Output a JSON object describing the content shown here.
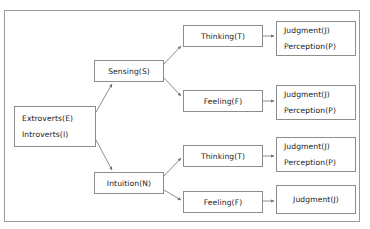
{
  "diagram": {
    "background_color": "#ffffff",
    "border_color": "#9a9a9a",
    "box_border_color": "#8d8d8d",
    "text_color": "#1a1a1a",
    "edge_color": "#6e6e6e",
    "nodes": [
      {
        "id": "attitude",
        "lines": [
          "Extroverts(E)",
          "Introverts(I)"
        ],
        "x": 14,
        "y": 106,
        "w": 82,
        "h": 41
      },
      {
        "id": "sensing",
        "lines": [
          "Sensing(S)"
        ],
        "x": 94,
        "y": 60,
        "w": 70,
        "h": 22
      },
      {
        "id": "intuition",
        "lines": [
          "Intuition(N)"
        ],
        "x": 94,
        "y": 172,
        "w": 70,
        "h": 22
      },
      {
        "id": "thinking-top",
        "lines": [
          "Thinking(T)"
        ],
        "x": 183,
        "y": 25,
        "w": 80,
        "h": 22
      },
      {
        "id": "feeling-top",
        "lines": [
          "Feeling(F)"
        ],
        "x": 183,
        "y": 90,
        "w": 80,
        "h": 22
      },
      {
        "id": "thinking-bottom",
        "lines": [
          "Thinking(T)"
        ],
        "x": 183,
        "y": 145,
        "w": 80,
        "h": 22
      },
      {
        "id": "feeling-bottom",
        "lines": [
          "Feeling(F)"
        ],
        "x": 183,
        "y": 191,
        "w": 80,
        "h": 22
      },
      {
        "id": "outcome-1",
        "lines": [
          "Judgment(J)",
          "Perception(P)"
        ],
        "x": 276,
        "y": 21,
        "w": 80,
        "h": 35
      },
      {
        "id": "outcome-2",
        "lines": [
          "Judgment(J)",
          "Perception(P)"
        ],
        "x": 276,
        "y": 85,
        "w": 80,
        "h": 35
      },
      {
        "id": "outcome-3",
        "lines": [
          "Judgment(J)",
          "Perception(P)"
        ],
        "x": 276,
        "y": 137,
        "w": 80,
        "h": 35
      },
      {
        "id": "outcome-4",
        "lines": [
          "Judgment(J)"
        ],
        "x": 276,
        "y": 185,
        "w": 80,
        "h": 29
      }
    ],
    "edges": [
      {
        "id": "attitude-to-sensing",
        "from": "attitude",
        "to": "sensing",
        "x1": 96,
        "y1": 112,
        "x2": 112,
        "y2": 84
      },
      {
        "id": "attitude-to-intuition",
        "from": "attitude",
        "to": "intuition",
        "x1": 96,
        "y1": 140,
        "x2": 112,
        "y2": 170
      },
      {
        "id": "sensing-to-thinking",
        "from": "sensing",
        "to": "thinking-top",
        "x1": 164,
        "y1": 64,
        "x2": 181,
        "y2": 46
      },
      {
        "id": "sensing-to-feeling",
        "from": "sensing",
        "to": "feeling-top",
        "x1": 164,
        "y1": 78,
        "x2": 181,
        "y2": 96
      },
      {
        "id": "intuition-to-thinking",
        "from": "intuition",
        "to": "thinking-bottom",
        "x1": 164,
        "y1": 176,
        "x2": 181,
        "y2": 158
      },
      {
        "id": "intuition-to-feeling",
        "from": "intuition",
        "to": "feeling-bottom",
        "x1": 164,
        "y1": 190,
        "x2": 181,
        "y2": 200
      },
      {
        "id": "thinking-top-to-outcome1",
        "from": "thinking-top",
        "to": "outcome-1",
        "x1": 263,
        "y1": 36,
        "x2": 274,
        "y2": 36
      },
      {
        "id": "feeling-top-to-outcome2",
        "from": "feeling-top",
        "to": "outcome-2",
        "x1": 263,
        "y1": 101,
        "x2": 274,
        "y2": 101
      },
      {
        "id": "thinking-bot-to-outcome3",
        "from": "thinking-bottom",
        "to": "outcome-3",
        "x1": 263,
        "y1": 156,
        "x2": 274,
        "y2": 156
      },
      {
        "id": "feeling-bot-to-outcome4",
        "from": "feeling-bottom",
        "to": "outcome-4",
        "x1": 263,
        "y1": 201,
        "x2": 274,
        "y2": 201
      }
    ]
  }
}
